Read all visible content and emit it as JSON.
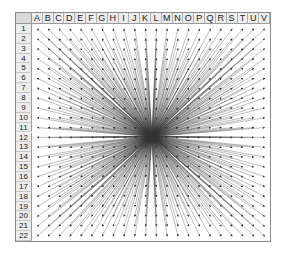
{
  "spreadsheet": {
    "columns": [
      "A",
      "B",
      "C",
      "D",
      "E",
      "F",
      "G",
      "H",
      "I",
      "J",
      "K",
      "L",
      "M",
      "N",
      "O",
      "P",
      "Q",
      "R",
      "S",
      "T",
      "U",
      "V"
    ],
    "rows": [
      "1",
      "2",
      "3",
      "4",
      "5",
      "6",
      "7",
      "8",
      "9",
      "10",
      "11",
      "12",
      "13",
      "14",
      "15",
      "16",
      "17",
      "18",
      "19",
      "20",
      "21",
      "22"
    ],
    "arrow_color": "#333333",
    "header_bg": "#ececec",
    "arrows": {
      "origin_description": "all arrows radiate from center cell near J/K, row 11/12",
      "count": 484,
      "direction": "outward from center to each cell"
    }
  }
}
